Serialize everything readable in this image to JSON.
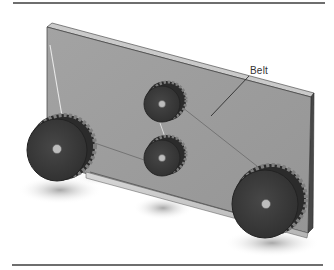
{
  "figure": {
    "callouts": [
      {
        "label": "Belt"
      }
    ],
    "components": [
      {
        "name": "mounting-plate"
      },
      {
        "name": "large-pulley-left"
      },
      {
        "name": "small-pulley-upper"
      },
      {
        "name": "small-pulley-lower"
      },
      {
        "name": "large-pulley-right"
      },
      {
        "name": "belt"
      }
    ],
    "colors": {
      "rule": "#6e6e6e",
      "plate_face": "#9d9d9d",
      "plate_top_edge": "#c9c9c9",
      "plate_side_edge": "#4a4a4a",
      "pulley_face": "#3c3c3c",
      "pulley_rim": "#2a2a2a",
      "pulley_teeth_light": "#8a8a8a",
      "hub": "#bdbdbd",
      "belt": "#6a6a6a",
      "shadow": "#9a9a9a"
    }
  }
}
